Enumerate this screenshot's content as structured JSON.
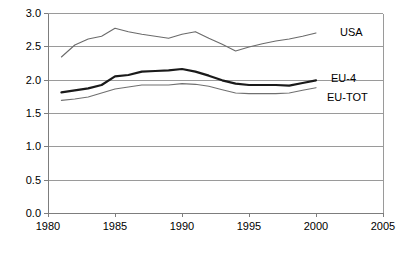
{
  "chart_data": {
    "type": "line",
    "title": "",
    "subtitle": "",
    "xlabel": "",
    "ylabel": "",
    "xlim": [
      1980,
      2005
    ],
    "ylim": [
      0.0,
      3.0
    ],
    "grid": "horizontal",
    "legend_position": "inline-right-of-series",
    "x_ticks": [
      "1980",
      "1985",
      "1990",
      "1995",
      "2000",
      "2005"
    ],
    "x_tick_values": [
      1980,
      1985,
      1990,
      1995,
      2000,
      2005
    ],
    "y_ticks": [
      "0.0",
      "0.5",
      "1.0",
      "1.5",
      "2.0",
      "2.5",
      "3.0"
    ],
    "y_tick_values": [
      0.0,
      0.5,
      1.0,
      1.5,
      2.0,
      2.5,
      3.0
    ],
    "x": [
      1981,
      1982,
      1983,
      1984,
      1985,
      1986,
      1987,
      1988,
      1989,
      1990,
      1991,
      1992,
      1993,
      1994,
      1995,
      1996,
      1997,
      1998,
      1999,
      2000
    ],
    "series": [
      {
        "name": "USA",
        "color": "#6b6b6b",
        "width": 1.1,
        "values": [
          2.34,
          2.52,
          2.61,
          2.65,
          2.77,
          2.72,
          2.68,
          2.65,
          2.62,
          2.68,
          2.72,
          2.62,
          2.53,
          2.43,
          2.49,
          2.54,
          2.58,
          2.61,
          2.65,
          2.7
        ]
      },
      {
        "name": "EU-4",
        "color": "#1a1a1a",
        "width": 2.2,
        "values": [
          1.81,
          1.84,
          1.87,
          1.92,
          2.05,
          2.07,
          2.12,
          2.13,
          2.14,
          2.16,
          2.12,
          2.06,
          1.99,
          1.94,
          1.92,
          1.92,
          1.92,
          1.91,
          1.95,
          1.99
        ]
      },
      {
        "name": "EU-TOT",
        "color": "#707070",
        "width": 1.1,
        "values": [
          1.69,
          1.71,
          1.74,
          1.8,
          1.86,
          1.89,
          1.92,
          1.92,
          1.92,
          1.94,
          1.93,
          1.9,
          1.85,
          1.8,
          1.79,
          1.79,
          1.79,
          1.8,
          1.84,
          1.88
        ]
      }
    ],
    "series_label_positions": [
      {
        "name": "USA",
        "x": 340,
        "y": 36
      },
      {
        "name": "EU-4",
        "x": 331,
        "y": 82
      },
      {
        "name": "EU-TOT",
        "x": 327,
        "y": 101
      }
    ]
  },
  "plot_geometry": {
    "left": 48,
    "right": 383,
    "top": 13,
    "bottom": 213
  }
}
